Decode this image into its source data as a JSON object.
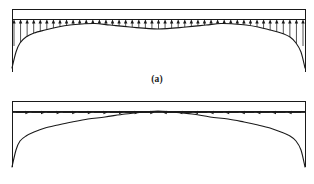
{
  "figure": {
    "background_color": "#ffffff",
    "line_color": "#1a1a1a",
    "beam_fill_color": "#ffffff",
    "panels": [
      {
        "id": "a",
        "caption": "(a)",
        "load_direction": "vertical-upward",
        "arrow_count": 45,
        "beam": {
          "x": 12,
          "y": 9,
          "width": 293,
          "height": 10
        },
        "description": "Uniform beam with vertical upward arrows whose tails terminate on a curved envelope that dips at midspan and plunges steeply at both supports"
      },
      {
        "id": "b",
        "caption": "(b)",
        "load_direction": "horizontal-inward",
        "arrow_count": 18,
        "beam": {
          "x": 12,
          "y": 101,
          "width": 293,
          "height": 10
        },
        "description": "Uniform beam with horizontal arrows pointing inward toward midspan; a curved envelope peaks at midspan and plunges steeply at both supports"
      }
    ]
  },
  "chart_data": {
    "type": "line",
    "xlabel": "",
    "ylabel": "",
    "panels": [
      {
        "id": "a",
        "caption": "(a)",
        "type": "line",
        "series": [
          {
            "name": "vertical load envelope (a)",
            "x": [
              12,
              16,
              20,
              26,
              34,
              45,
              58,
              70,
              82,
              95,
              110,
              130,
              158,
              186,
              206,
              221,
              234,
              246,
              258,
              270,
              281,
              290,
              296,
              301,
              305
            ],
            "y": [
              68,
              52,
              43,
              37,
              33,
              30,
              27,
              25,
              24,
              23.5,
              25,
              27,
              29,
              27,
              25,
              23.5,
              24,
              25,
              27,
              30,
              33,
              37,
              43,
              52,
              68
            ]
          },
          {
            "name": "beam top edge (a)",
            "x": [
              12,
              305
            ],
            "y": [
              9,
              9
            ]
          },
          {
            "name": "beam bottom edge (a)",
            "x": [
              12,
              305
            ],
            "y": [
              19,
              19
            ]
          }
        ],
        "arrow_count": 45,
        "arrow_direction": "up",
        "xlim": [
          12,
          305
        ],
        "ylim": [
          9,
          70
        ],
        "grid": false,
        "legend": "none"
      },
      {
        "id": "b",
        "caption": "(b)",
        "type": "line",
        "series": [
          {
            "name": "horizontal load envelope (b)",
            "x": [
              12,
              16,
              20,
              26,
              34,
              45,
              58,
              72,
              88,
              105,
              125,
              145,
              158,
              172,
              192,
              210,
              228,
              244,
              258,
              270,
              281,
              290,
              296,
              301,
              305
            ],
            "y": [
              167,
              150,
              141,
              136,
              132,
              128,
              125,
              122,
              119,
              117,
              114,
              112,
              111,
              112,
              114,
              117,
              119,
              122,
              125,
              128,
              132,
              136,
              141,
              150,
              167
            ]
          },
          {
            "name": "beam top edge (b)",
            "x": [
              12,
              305
            ],
            "y": [
              101,
              101
            ]
          },
          {
            "name": "beam bottom edge (b)",
            "x": [
              12,
              305
            ],
            "y": [
              111,
              111
            ]
          }
        ],
        "arrow_count": 18,
        "arrow_direction": "inward",
        "xlim": [
          12,
          305
        ],
        "ylim": [
          101,
          168
        ],
        "grid": false,
        "legend": "none"
      }
    ]
  }
}
